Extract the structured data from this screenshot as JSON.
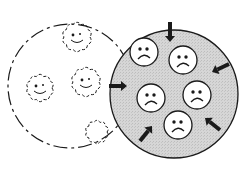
{
  "diagram": {
    "colors": {
      "background": "#ffffff",
      "ink": "#1a1a1a",
      "gray_fill": "#d4d4d4",
      "face_fill": "#ffffff"
    },
    "left_circle": {
      "style": "dashed",
      "fill": "white",
      "cx": 70,
      "cy": 86,
      "r": 62,
      "faces": [
        {
          "type": "happy-fuzzy",
          "cx": 77,
          "cy": 37,
          "r": 13
        },
        {
          "type": "happy-fuzzy",
          "cx": 40,
          "cy": 88,
          "r": 12
        },
        {
          "type": "happy-fuzzy",
          "cx": 86,
          "cy": 82,
          "r": 13
        },
        {
          "type": "happy-fuzzy-partial",
          "cx": 97,
          "cy": 132,
          "r": 10
        }
      ]
    },
    "right_circle": {
      "style": "solid",
      "fill": "gray",
      "cx": 174,
      "cy": 94,
      "r": 64,
      "faces": [
        {
          "type": "sad",
          "cx": 144,
          "cy": 52,
          "r": 14
        },
        {
          "type": "sad",
          "cx": 183,
          "cy": 60,
          "r": 14
        },
        {
          "type": "sad",
          "cx": 151,
          "cy": 98,
          "r": 14
        },
        {
          "type": "sad",
          "cx": 197,
          "cy": 95,
          "r": 14
        },
        {
          "type": "sad",
          "cx": 178,
          "cy": 125,
          "r": 14
        }
      ],
      "arrows": [
        {
          "direction": "down",
          "x1": 170,
          "y1": 22,
          "x2": 170,
          "y2": 42
        },
        {
          "direction": "down-left",
          "x1": 229,
          "y1": 64,
          "x2": 212,
          "y2": 72
        },
        {
          "direction": "right",
          "x1": 109,
          "y1": 86,
          "x2": 127,
          "y2": 86
        },
        {
          "direction": "up-left",
          "x1": 220,
          "y1": 130,
          "x2": 205,
          "y2": 118
        },
        {
          "direction": "up-right",
          "x1": 140,
          "y1": 141,
          "x2": 152,
          "y2": 126
        }
      ]
    }
  }
}
